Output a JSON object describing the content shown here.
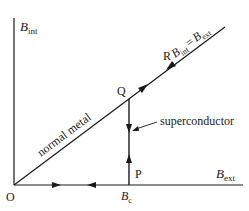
{
  "diagram": {
    "type": "hysteresis-path",
    "axes": {
      "y_label": {
        "main": "B",
        "sub": "int"
      },
      "x_label": {
        "main": "B",
        "sub": "ext"
      },
      "origin_label": "O"
    },
    "lines": {
      "diagonal_label": "normal metal",
      "equation": {
        "lhs_main": "B",
        "lhs_sub": "int",
        "eq": "=",
        "rhs_main": "B",
        "rhs_sub": "ext"
      }
    },
    "points": {
      "Q": "Q",
      "R": "R",
      "P": "P",
      "Bc": {
        "main": "B",
        "sub": "c"
      }
    },
    "annotations": {
      "superconductor": "superconductor"
    },
    "colors": {
      "ink": "#1a1a1a",
      "background": "#ffffff"
    }
  }
}
